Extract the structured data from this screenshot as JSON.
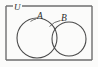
{
  "diagram": {
    "kind": "venn-diagram",
    "background_color": "#fbfbfa",
    "stroke_color": "#4a4a4a",
    "frame_color": "#6e6e6e",
    "label_color": "#2b2b2b",
    "universe": {
      "label": "U",
      "label_x": 17,
      "label_y": 10,
      "rect": {
        "x": 6,
        "y": 6,
        "width": 86,
        "height": 54
      },
      "label_gap": {
        "x": 13,
        "width": 9
      }
    },
    "sets": [
      {
        "id": "A",
        "label": "A",
        "label_x": 38,
        "label_y": 18,
        "cx": 37,
        "cy": 38,
        "r": 20,
        "leader": {
          "x1": 31,
          "y1": 20,
          "x2": 36,
          "y2": 18.5
        }
      },
      {
        "id": "B",
        "label": "B",
        "label_x": 62,
        "label_y": 21,
        "cx": 69,
        "cy": 39,
        "r": 17,
        "leader": {
          "x1": 45,
          "y1": 19,
          "x2": 60,
          "y2": 21
        }
      }
    ],
    "regions": [
      {
        "name": "A only",
        "description": "left lune"
      },
      {
        "name": "A and B",
        "description": "central lens-shaped intersection"
      },
      {
        "name": "B only",
        "description": "right lune"
      },
      {
        "name": "neither",
        "description": "rectangle interior outside both circles"
      }
    ]
  }
}
